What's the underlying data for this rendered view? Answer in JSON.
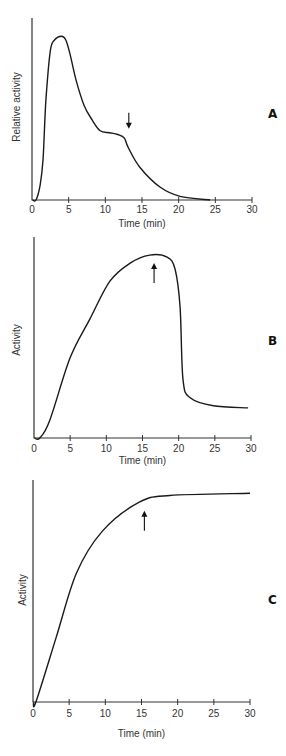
{
  "chart_data": [
    {
      "type": "line",
      "panel_label": "A",
      "title": "",
      "xlabel": "Time (min)",
      "ylabel": "Relative activity",
      "xlim": [
        0,
        30
      ],
      "ylim": [
        0,
        100
      ],
      "x_ticks": [
        0,
        5,
        10,
        15,
        20,
        25,
        30
      ],
      "grid": false,
      "legend": null,
      "series": [
        {
          "name": "activity",
          "x": [
            0.55,
            1.1,
            1.5,
            1.9,
            2.5,
            3.1,
            4.0,
            4.6,
            5.2,
            6.0,
            7.1,
            8.2,
            9.3,
            10.6,
            11.7,
            12.6,
            13.1,
            14.7,
            17.5,
            20.2,
            24.3
          ],
          "y": [
            0,
            8,
            22,
            55,
            82,
            88,
            90,
            88,
            80,
            66,
            52,
            44,
            38,
            37,
            36,
            34,
            29,
            18,
            7,
            2,
            0
          ]
        }
      ],
      "annotations": [
        {
          "type": "arrow",
          "direction": "down",
          "x": 13.2,
          "y": 38
        }
      ]
    },
    {
      "type": "line",
      "panel_label": "B",
      "title": "",
      "xlabel": "Time (min)",
      "ylabel": "Activity",
      "xlim": [
        0,
        30
      ],
      "ylim": [
        0,
        100
      ],
      "x_ticks": [
        0,
        5,
        10,
        15,
        20,
        25,
        30
      ],
      "grid": false,
      "legend": null,
      "series": [
        {
          "name": "activity",
          "x": [
            0.8,
            2.2,
            5.0,
            7.7,
            10.5,
            13.3,
            16.0,
            18.4,
            19.5,
            20.2,
            20.6,
            21.6,
            24.8,
            29.6
          ],
          "y": [
            0,
            9,
            40,
            59,
            78,
            87,
            91,
            90,
            84,
            65,
            29,
            20,
            16,
            15
          ]
        }
      ],
      "annotations": [
        {
          "type": "arrow",
          "direction": "up",
          "x": 16.6,
          "y": 88
        }
      ]
    },
    {
      "type": "line",
      "panel_label": "C",
      "title": "",
      "xlabel": "Time (min)",
      "ylabel": "Activity",
      "xlim": [
        0,
        30
      ],
      "ylim": [
        0,
        100
      ],
      "x_ticks": [
        0,
        5,
        10,
        15,
        20,
        25,
        30
      ],
      "grid": false,
      "legend": null,
      "series": [
        {
          "name": "activity",
          "x": [
            0.4,
            3.2,
            6.0,
            9.6,
            14.7,
            18.9,
            30
          ],
          "y": [
            0,
            29,
            58,
            77,
            90,
            93,
            94
          ]
        }
      ],
      "annotations": [
        {
          "type": "arrow",
          "direction": "up",
          "x": 15.4,
          "y": 87
        }
      ]
    }
  ],
  "layout": {
    "panels": [
      {
        "x0": 32,
        "x1": 252,
        "y0": 200,
        "ytop": 18,
        "label_pos": [
          268,
          118
        ],
        "ylabel_pos": [
          20,
          107
        ],
        "xlabel_y": 227,
        "ticklbl_y": 213
      },
      {
        "x0": 34,
        "x1": 251,
        "y0": 438,
        "ytop": 237,
        "label_pos": [
          268,
          345
        ],
        "ylabel_pos": [
          20,
          340
        ],
        "xlabel_y": 464,
        "ticklbl_y": 452
      },
      {
        "x0": 33,
        "x1": 250,
        "y0": 702,
        "ytop": 480,
        "label_pos": [
          268,
          604
        ],
        "ylabel_pos": [
          26,
          590
        ],
        "xlabel_y": 737,
        "ticklbl_y": 717
      }
    ]
  }
}
